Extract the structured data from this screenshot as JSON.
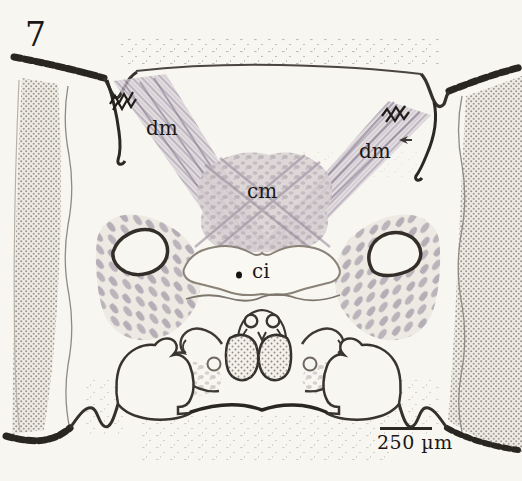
{
  "figure": {
    "number": "7",
    "annotations": [
      {
        "id": "dm-left",
        "text": "dm"
      },
      {
        "id": "dm-right",
        "text": "dm"
      },
      {
        "id": "cm",
        "text": "cm"
      },
      {
        "id": "ci",
        "text": "ci"
      }
    ],
    "scale_bar": {
      "label": "250 µm"
    },
    "colors": {
      "background": "#f8f6f1",
      "ink": "#2c2824",
      "label_text": "#1b1817",
      "tissue_gray": "#c7c0c6"
    }
  }
}
